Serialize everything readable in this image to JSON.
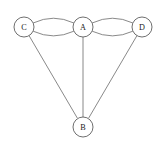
{
  "diagram": {
    "type": "undirected-multigraph",
    "background_color": "#ffffff",
    "node_fill_color": "#ffffff",
    "node_stroke_color": "#555555",
    "edge_stroke_color": "#6b6b6b",
    "label_color": "#1a1a1a",
    "node_radius": 10,
    "nodes": [
      {
        "id": "C",
        "label": "C",
        "cx": 24,
        "cy": 27
      },
      {
        "id": "A",
        "label": "A",
        "cx": 83,
        "cy": 27
      },
      {
        "id": "D",
        "label": "D",
        "cx": 142,
        "cy": 27
      },
      {
        "id": "B",
        "label": "B",
        "cx": 83,
        "cy": 127
      }
    ],
    "edges": [
      {
        "from": "C",
        "to": "A",
        "shape": "curve-up",
        "path": "M 33.6 22.8 Q 53.5 13.5 73.4 22.8"
      },
      {
        "from": "C",
        "to": "A",
        "shape": "curve-down",
        "path": "M 33.6 31.4 Q 53.5 40.5 73.4 31.4"
      },
      {
        "from": "A",
        "to": "D",
        "shape": "curve-up",
        "path": "M 92.6 22.8 Q 112.5 13.5 132.4 22.8"
      },
      {
        "from": "A",
        "to": "D",
        "shape": "curve-down",
        "path": "M 92.6 31.4 Q 112.5 40.5 132.4 31.4"
      },
      {
        "from": "C",
        "to": "B",
        "shape": "straight",
        "path": "M 29.1 35.7 L 77.1 117.7"
      },
      {
        "from": "A",
        "to": "B",
        "shape": "straight",
        "path": "M 83 37 L 83 117"
      },
      {
        "from": "D",
        "to": "B",
        "shape": "straight",
        "path": "M 136.9 35.7 L 88.9 117.7"
      }
    ]
  }
}
